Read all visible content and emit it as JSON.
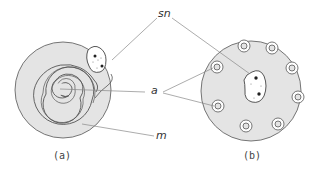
{
  "figure": {
    "panels": [
      {
        "id": "a",
        "caption": "(a)",
        "description": "myelinated fiber cross-section with spiral myelin wrapping"
      },
      {
        "id": "b",
        "caption": "(b)",
        "description": "unmyelinated fiber cross-section with multiple embedded axons"
      }
    ],
    "labels": {
      "sn": "sn",
      "a": "a",
      "m": "m"
    },
    "colors": {
      "fill": "#e4e4e4",
      "line": "#555555",
      "leader": "#888888",
      "background": "#ffffff"
    }
  }
}
